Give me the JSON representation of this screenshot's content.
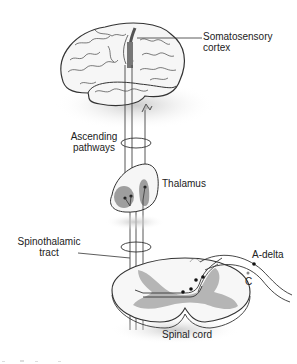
{
  "diagram": {
    "type": "anatomical-pathway",
    "labels": {
      "somatosensory_cortex_line1": "Somatosensory",
      "somatosensory_cortex_line2": "cortex",
      "ascending_pathways_line1": "Ascending",
      "ascending_pathways_line2": "pathways",
      "thalamus": "Thalamus",
      "spinothalamic_tract_line1": "Spinothalamic",
      "spinothalamic_tract_line2": "tract",
      "a_delta": "A-delta",
      "c_fiber": "C",
      "spinal_cord": "Spinal cord"
    },
    "structures": [
      "brain",
      "ascending-pathways",
      "thalamus",
      "spinothalamic-tract",
      "spinal-cord",
      "a-delta-fiber",
      "c-fiber"
    ],
    "colors": {
      "outline": "#333333",
      "fill_light": "#f4f4f4",
      "gray_matter": "#b5b5b5",
      "shadow": "#cfcfcf",
      "text": "#222222"
    }
  }
}
